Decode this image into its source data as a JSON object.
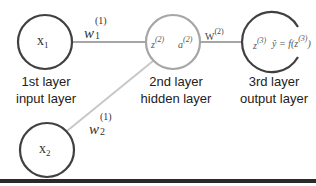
{
  "nodes": {
    "x1": {
      "label_base": "x",
      "label_sub": "1"
    },
    "x2": {
      "label_base": "x",
      "label_sub": "2"
    },
    "hidden": {
      "z_base": "z",
      "z_sup": "(2)",
      "a_base": "a",
      "a_sup": "(2)"
    },
    "output": {
      "z_base": "z",
      "z_sup": "(3)",
      "yhat_text": "ŷ = f(z",
      "yhat_sup": "(3)",
      "yhat_close": ")"
    }
  },
  "weights": {
    "w1": {
      "base": "w",
      "sub": "1",
      "sup": "(1)"
    },
    "w2": {
      "base": "w",
      "sub": "2",
      "sup": "(1)"
    },
    "W2": {
      "base": "W",
      "sup": "(2)"
    }
  },
  "layers": [
    {
      "line1": "1st layer",
      "line2": "input layer"
    },
    {
      "line1": "2nd layer",
      "line2": "hidden layer"
    },
    {
      "line1": "3rd layer",
      "line2": "output layer"
    }
  ],
  "colors": {
    "dark_stroke": "#404040",
    "light_stroke": "#a6a6a6",
    "edge": "#a6a6a6",
    "bottom_bar": "#2a2a2a"
  }
}
